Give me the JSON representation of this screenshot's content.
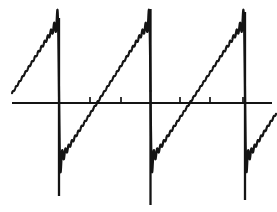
{
  "figure": {
    "title": "",
    "caption": "",
    "background_color": "#ffffff",
    "ink_color": "#141414",
    "width": 277,
    "height": 212
  },
  "chart_data": {
    "type": "line",
    "title": "",
    "subtitle": "",
    "xlabel": "",
    "ylabel": "",
    "grid": false,
    "legend": null,
    "legend_position": "none",
    "axes": {
      "x_axis_visible": true,
      "y_axis_visible": false,
      "x_axis_pixel_y": 103,
      "x_axis_pixel_x_start": 12,
      "x_axis_pixel_x_end": 272,
      "xlim": [
        -1.62,
        1.34
      ],
      "ylim": [
        -1.31,
        1.31
      ],
      "x_tick_labels": [],
      "y_tick_labels": [],
      "x_tick_pixel_positions": [
        90,
        121,
        180,
        210,
        243
      ],
      "x_ticks": [
        -0.66,
        -0.32,
        0.33,
        0.66,
        1.0
      ],
      "tick_length_px": 6,
      "tick_direction": "up"
    },
    "waveform": {
      "name": "sawtooth",
      "period_px": 91,
      "amplitude": 1.0,
      "peak_pixel_y": 20,
      "trough_pixel_y": 162,
      "harmonics": 28,
      "gibbs_overshoot_ratio": 0.089,
      "discontinuity_pixel_x": [
        59,
        150.5,
        245
      ],
      "discontinuity_lines": [
        {
          "x": 59,
          "y_top": 18,
          "y_bottom": 196
        },
        {
          "x": 150.5,
          "y_top": 9,
          "y_bottom": 205
        },
        {
          "x": 245,
          "y_top": 12,
          "y_bottom": 200
        }
      ],
      "segments": [
        {
          "id": "segment-left-partial",
          "x_start": 12,
          "x_end": 59,
          "y_start": 68,
          "y_end": 20
        },
        {
          "id": "segment-main-left",
          "x_start": 59,
          "x_end": 150.5,
          "y_start": 162,
          "y_end": 20
        },
        {
          "id": "segment-main-right",
          "x_start": 150.5,
          "x_end": 245,
          "y_start": 162,
          "y_end": 20
        },
        {
          "id": "segment-right-partial",
          "x_start": 245,
          "x_end": 272,
          "y_start": 200,
          "y_end": 186
        }
      ]
    },
    "series": [
      {
        "name": "partial-sum",
        "color": "#141414",
        "line_width_px": 2.2,
        "x": [
          -1.62,
          -1.3,
          -1.0,
          -0.7,
          -0.5,
          -0.5,
          -0.25,
          0.0,
          0.25,
          0.5,
          0.5,
          0.75,
          1.0,
          1.0,
          1.15,
          1.34
        ],
        "values": [
          -0.34,
          -0.1,
          0.14,
          0.38,
          1.0,
          -1.0,
          -0.5,
          0.0,
          0.5,
          1.0,
          -1.0,
          -0.5,
          1.0,
          -1.0,
          -0.89,
          -0.79
        ]
      }
    ]
  }
}
